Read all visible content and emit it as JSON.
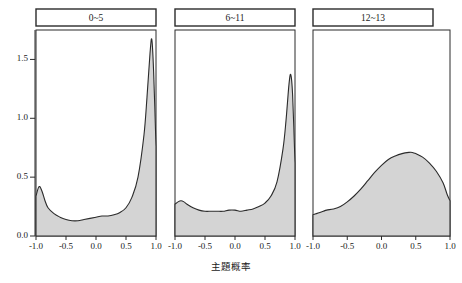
{
  "chart_data": {
    "type": "area",
    "title": "",
    "subtitle": "",
    "xlabel": "主題概率",
    "ylabel": "",
    "xlim": [
      -1.0,
      1.0
    ],
    "ylim": [
      0.0,
      1.75
    ],
    "grid": false,
    "legend": "none",
    "layout": "three horizontal facet panels sharing a common y-axis",
    "xticks": [
      "-1.0",
      "-0.5",
      "0.0",
      "0.5",
      "1.0"
    ],
    "xtick_values": [
      -1.0,
      -0.5,
      0.0,
      0.5,
      1.0
    ],
    "yticks": [
      "0.0",
      "0.5",
      "1.0",
      "1.5"
    ],
    "ytick_values": [
      0.0,
      0.5,
      1.0,
      1.5
    ],
    "fill_color": "#d4d4d4",
    "line_color": "#2b2b2b",
    "panels": [
      {
        "label": "0~5",
        "x": [
          -1.0,
          -0.95,
          -0.9,
          -0.85,
          -0.8,
          -0.7,
          -0.6,
          -0.5,
          -0.4,
          -0.3,
          -0.2,
          -0.1,
          0.0,
          0.1,
          0.2,
          0.3,
          0.4,
          0.5,
          0.6,
          0.7,
          0.8,
          0.85,
          0.9,
          0.93,
          0.96,
          1.0
        ],
        "y": [
          0.34,
          0.42,
          0.38,
          0.3,
          0.24,
          0.19,
          0.16,
          0.14,
          0.13,
          0.13,
          0.14,
          0.15,
          0.16,
          0.17,
          0.17,
          0.18,
          0.2,
          0.24,
          0.33,
          0.5,
          0.86,
          1.18,
          1.55,
          1.67,
          1.4,
          0.76
        ],
        "peak_x": 0.93,
        "peak_y": 1.67
      },
      {
        "label": "6~11",
        "x": [
          -1.0,
          -0.95,
          -0.9,
          -0.85,
          -0.8,
          -0.7,
          -0.6,
          -0.5,
          -0.4,
          -0.3,
          -0.2,
          -0.1,
          0.0,
          0.1,
          0.2,
          0.3,
          0.4,
          0.5,
          0.6,
          0.7,
          0.8,
          0.85,
          0.9,
          0.93,
          0.96,
          1.0
        ],
        "y": [
          0.27,
          0.29,
          0.3,
          0.29,
          0.27,
          0.24,
          0.22,
          0.21,
          0.21,
          0.21,
          0.21,
          0.22,
          0.22,
          0.21,
          0.22,
          0.23,
          0.25,
          0.28,
          0.34,
          0.46,
          0.74,
          0.98,
          1.29,
          1.37,
          1.2,
          0.62
        ],
        "peak_x": 0.9,
        "peak_y": 1.37
      },
      {
        "label": "12~13",
        "x": [
          -1.0,
          -0.95,
          -0.9,
          -0.85,
          -0.8,
          -0.7,
          -0.6,
          -0.5,
          -0.4,
          -0.3,
          -0.2,
          -0.1,
          0.0,
          0.1,
          0.2,
          0.3,
          0.4,
          0.45,
          0.5,
          0.6,
          0.7,
          0.8,
          0.9,
          0.96,
          1.0
        ],
        "y": [
          0.18,
          0.19,
          0.2,
          0.21,
          0.22,
          0.23,
          0.25,
          0.29,
          0.34,
          0.4,
          0.47,
          0.54,
          0.6,
          0.65,
          0.68,
          0.7,
          0.71,
          0.71,
          0.7,
          0.67,
          0.62,
          0.55,
          0.45,
          0.35,
          0.3
        ],
        "peak_x": 0.45,
        "peak_y": 0.71
      }
    ]
  }
}
